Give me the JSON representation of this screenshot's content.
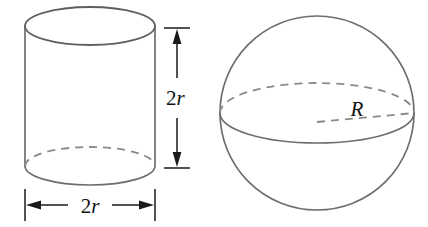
{
  "figure": {
    "background_color": "#ffffff",
    "shape_stroke_color": "#6e6e6e",
    "hidden_edge_color": "#8a8a8a",
    "dimension_color": "#1a1a1a"
  },
  "cylinder": {
    "name": "cylinder",
    "height_label": "2r",
    "height_label_number": "2",
    "height_label_variable": "r",
    "diameter_label": "2r",
    "diameter_label_number": "2",
    "diameter_label_variable": "r",
    "geometry": {
      "left_x": 25,
      "right_x": 155,
      "top_ellipse_center_y": 26,
      "bottom_ellipse_center_y": 166,
      "ellipse_rx": 65,
      "ellipse_ry": 19
    }
  },
  "sphere": {
    "name": "sphere",
    "radius_label": "R",
    "geometry": {
      "center_x": 317,
      "center_y": 113,
      "radius": 97,
      "equator_rx": 97,
      "equator_ry": 30
    }
  },
  "dimensions": {
    "vertical": {
      "name": "height-dimension",
      "label": "2r",
      "x": 177,
      "top_y": 28,
      "bottom_y": 168,
      "tick_half_width": 13
    },
    "horizontal": {
      "name": "diameter-dimension",
      "label": "2r",
      "y": 205,
      "left_x": 25,
      "right_x": 155,
      "tick_half_height": 16
    }
  }
}
